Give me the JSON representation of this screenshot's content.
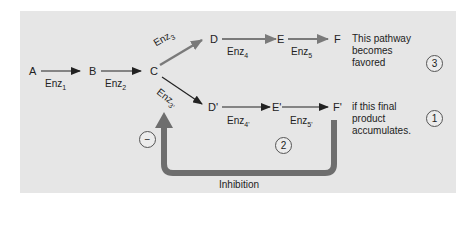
{
  "diagram": {
    "title": "",
    "nodes": {
      "A": "A",
      "B": "B",
      "C": "C",
      "D": "D",
      "E": "E",
      "F": "F",
      "D_prime": "D'",
      "E_prime": "E'",
      "F_prime": "F'"
    },
    "enzymes": {
      "enz1": {
        "base": "Enz",
        "sub": "1"
      },
      "enz2": {
        "base": "Enz",
        "sub": "2"
      },
      "enz3": {
        "base": "Enz",
        "sub": "3"
      },
      "enz4": {
        "base": "Enz",
        "sub": "4"
      },
      "enz5": {
        "base": "Enz",
        "sub": "5"
      },
      "enz3p": {
        "base": "Enz",
        "sub": "3'"
      },
      "enz4p": {
        "base": "Enz",
        "sub": "4'"
      },
      "enz5p": {
        "base": "Enz",
        "sub": "5'"
      }
    },
    "notes": {
      "favored": [
        "This pathway",
        "becomes",
        "favored"
      ],
      "accumulates": [
        "if this final",
        "product",
        "accumulates."
      ]
    },
    "steps": {
      "one": "1",
      "two": "2",
      "three": "3",
      "minus": "−"
    },
    "feedback_label": "Inhibition",
    "colors": {
      "background": "#e6e6e6",
      "upper_branch_arrow": "#7a7a7a",
      "feedback_arrow": "#6e6e6e",
      "main_arrow": "#222222"
    }
  }
}
